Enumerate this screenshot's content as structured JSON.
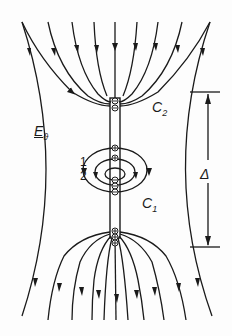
{
  "figure": {
    "type": "electric field line diagram",
    "labels": {
      "c2": "C",
      "c2_sub": "2",
      "c1": "C",
      "c1_sub": "1",
      "field": "E",
      "field_sub": "ϑ",
      "line1": "1",
      "line2": "2",
      "gap": "Δ"
    },
    "colors": {
      "line": "#1a1a1a",
      "background": "#fdfdfd"
    },
    "elements": {
      "top_field_lines": 9,
      "bottom_field_lines": 9,
      "central_conductor": "vertical rod with charge markers",
      "top_charge_marker": "⊖⊖",
      "middle_charges_upper": "⊕⊕",
      "middle_charges_lower": "⊖⊖⊖",
      "bottom_charge_marker": "⊕⊕⊕",
      "dimension": "Δ between top of C2 region and bottom marker"
    }
  }
}
